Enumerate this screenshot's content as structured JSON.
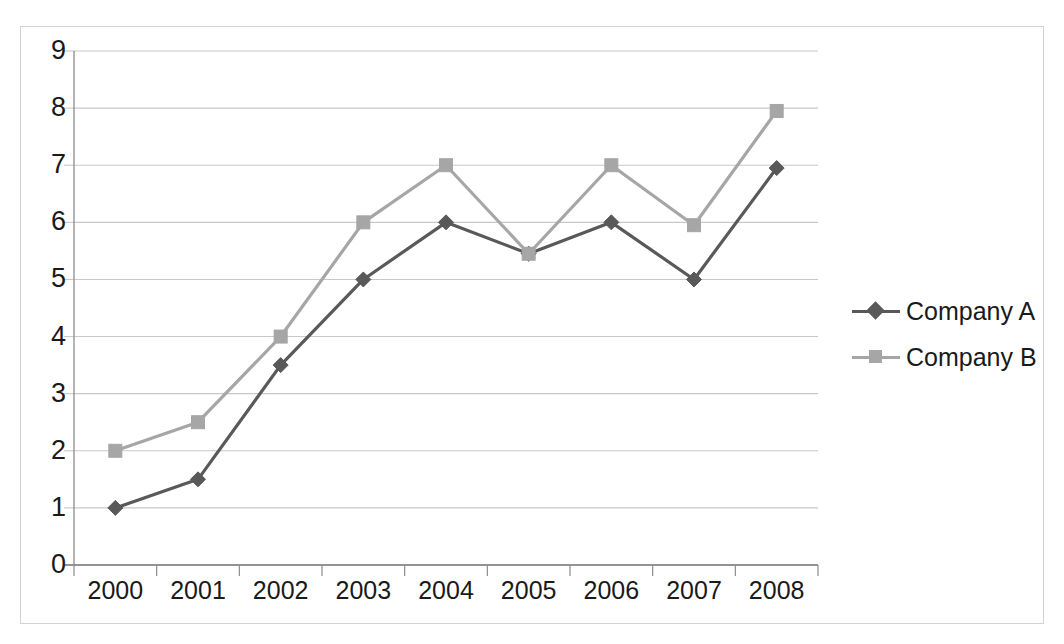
{
  "chart_data": {
    "type": "line",
    "title": "",
    "subtitle": "",
    "xlabel": "",
    "ylabel": "",
    "categories": [
      "2000",
      "2001",
      "2002",
      "2003",
      "2004",
      "2005",
      "2006",
      "2007",
      "2008"
    ],
    "series": [
      {
        "name": "Company A",
        "color": "#595959",
        "marker": "diamond",
        "values": [
          1.0,
          1.5,
          3.5,
          5.0,
          6.0,
          5.45,
          6.0,
          5.0,
          6.95
        ]
      },
      {
        "name": "Company B",
        "color": "#a6a6a6",
        "marker": "square",
        "values": [
          2.0,
          2.5,
          4.0,
          6.0,
          7.0,
          5.45,
          7.0,
          5.95,
          7.95
        ]
      }
    ],
    "ylim": [
      0,
      9
    ],
    "yticks": [
      "0",
      "1",
      "2",
      "3",
      "4",
      "5",
      "6",
      "7",
      "8",
      "9"
    ],
    "xtick_labels": [
      "2000",
      "2001",
      "2002",
      "2003",
      "2004",
      "2005",
      "2006",
      "2007",
      "2008"
    ],
    "grid": "horizontal",
    "legend_position": "right",
    "legend_entries": [
      "Company A",
      "Company B"
    ],
    "axis_color": "#8c8c8c",
    "grid_color": "#c8c8c8",
    "frame_color": "#d2d2d2",
    "background": "#ffffff"
  }
}
